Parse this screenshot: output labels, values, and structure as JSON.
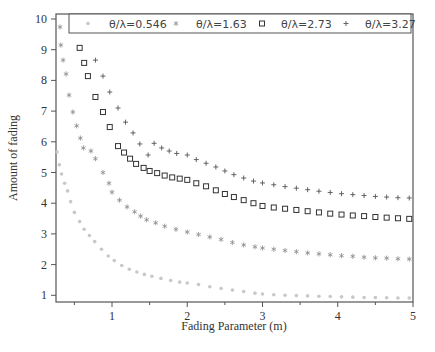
{
  "chart_data": {
    "type": "scatter",
    "title": "",
    "xlabel": "Fading Parameter (m)",
    "ylabel": "Amount of fading",
    "xlim": [
      0.25,
      5.0
    ],
    "ylim": [
      0.77,
      10.1
    ],
    "x_ticks": [
      1,
      2,
      3,
      4,
      5
    ],
    "x_minor_ticks": [
      0.5,
      1.5,
      2.5,
      3.5,
      4.5
    ],
    "y_ticks": [
      1,
      2,
      3,
      4,
      5,
      6,
      7,
      8,
      9,
      10
    ],
    "grid": false,
    "legend_position": "top-inside",
    "series": [
      {
        "name": "θ/λ=0.546",
        "marker": "dot",
        "color": "#c8c8c8",
        "points": [
          [
            0.27,
            5.67
          ],
          [
            0.3,
            5.25
          ],
          [
            0.33,
            4.95
          ],
          [
            0.37,
            4.65
          ],
          [
            0.41,
            4.4
          ],
          [
            0.45,
            4.05
          ],
          [
            0.5,
            3.7
          ],
          [
            0.57,
            3.4
          ],
          [
            0.63,
            3.15
          ],
          [
            0.7,
            2.95
          ],
          [
            0.77,
            2.75
          ],
          [
            0.86,
            2.5
          ],
          [
            0.95,
            2.28
          ],
          [
            1.03,
            2.13
          ],
          [
            1.13,
            1.97
          ],
          [
            1.23,
            1.85
          ],
          [
            1.33,
            1.76
          ],
          [
            1.43,
            1.68
          ],
          [
            1.53,
            1.62
          ],
          [
            1.65,
            1.55
          ],
          [
            1.78,
            1.48
          ],
          [
            1.9,
            1.43
          ],
          [
            2.0,
            1.4
          ],
          [
            2.15,
            1.35
          ],
          [
            2.3,
            1.28
          ],
          [
            2.45,
            1.22
          ],
          [
            2.6,
            1.17
          ],
          [
            2.75,
            1.12
          ],
          [
            2.9,
            1.07
          ],
          [
            3.0,
            1.04
          ],
          [
            3.15,
            1.02
          ],
          [
            3.3,
            1.0
          ],
          [
            3.45,
            0.99
          ],
          [
            3.6,
            0.98
          ],
          [
            3.75,
            0.97
          ],
          [
            3.9,
            0.96
          ],
          [
            4.05,
            0.95
          ],
          [
            4.2,
            0.94
          ],
          [
            4.35,
            0.93
          ],
          [
            4.5,
            0.93
          ],
          [
            4.65,
            0.92
          ],
          [
            4.8,
            0.91
          ],
          [
            4.95,
            0.91
          ]
        ]
      },
      {
        "name": "θ/λ=1.63",
        "marker": "star",
        "color": "#8a8a8a",
        "points": [
          [
            0.31,
            9.74
          ],
          [
            0.32,
            9.15
          ],
          [
            0.35,
            8.66
          ],
          [
            0.39,
            8.21
          ],
          [
            0.43,
            7.52
          ],
          [
            0.48,
            6.97
          ],
          [
            0.53,
            6.52
          ],
          [
            0.58,
            6.12
          ],
          [
            0.62,
            5.8
          ],
          [
            0.72,
            5.7
          ],
          [
            0.78,
            5.45
          ],
          [
            0.88,
            5.0
          ],
          [
            0.96,
            4.65
          ],
          [
            1.0,
            4.36
          ],
          [
            1.1,
            4.1
          ],
          [
            1.2,
            3.88
          ],
          [
            1.3,
            3.72
          ],
          [
            1.38,
            3.58
          ],
          [
            1.46,
            3.46
          ],
          [
            1.58,
            3.36
          ],
          [
            1.7,
            3.25
          ],
          [
            1.85,
            3.15
          ],
          [
            2.0,
            3.06
          ],
          [
            2.15,
            2.98
          ],
          [
            2.3,
            2.9
          ],
          [
            2.45,
            2.82
          ],
          [
            2.6,
            2.72
          ],
          [
            2.75,
            2.64
          ],
          [
            2.9,
            2.58
          ],
          [
            3.0,
            2.54
          ],
          [
            3.15,
            2.5
          ],
          [
            3.3,
            2.46
          ],
          [
            3.45,
            2.42
          ],
          [
            3.6,
            2.38
          ],
          [
            3.75,
            2.35
          ],
          [
            3.9,
            2.32
          ],
          [
            4.05,
            2.29
          ],
          [
            4.2,
            2.27
          ],
          [
            4.35,
            2.24
          ],
          [
            4.5,
            2.22
          ],
          [
            4.65,
            2.21
          ],
          [
            4.8,
            2.19
          ],
          [
            4.95,
            2.18
          ]
        ]
      },
      {
        "name": "θ/λ=2.73",
        "marker": "square",
        "color": "#333333",
        "points": [
          [
            0.57,
            9.06
          ],
          [
            0.63,
            8.57
          ],
          [
            0.68,
            8.14
          ],
          [
            0.78,
            7.46
          ],
          [
            0.88,
            6.97
          ],
          [
            0.97,
            6.48
          ],
          [
            1.08,
            5.86
          ],
          [
            1.16,
            5.65
          ],
          [
            1.24,
            5.45
          ],
          [
            1.32,
            5.28
          ],
          [
            1.42,
            5.15
          ],
          [
            1.5,
            5.05
          ],
          [
            1.6,
            4.98
          ],
          [
            1.7,
            4.9
          ],
          [
            1.8,
            4.84
          ],
          [
            1.9,
            4.8
          ],
          [
            2.0,
            4.76
          ],
          [
            2.12,
            4.65
          ],
          [
            2.25,
            4.55
          ],
          [
            2.38,
            4.42
          ],
          [
            2.5,
            4.3
          ],
          [
            2.62,
            4.2
          ],
          [
            2.75,
            4.1
          ],
          [
            2.88,
            4.0
          ],
          [
            3.0,
            3.91
          ],
          [
            3.15,
            3.86
          ],
          [
            3.3,
            3.82
          ],
          [
            3.45,
            3.78
          ],
          [
            3.6,
            3.74
          ],
          [
            3.75,
            3.7
          ],
          [
            3.9,
            3.66
          ],
          [
            4.05,
            3.63
          ],
          [
            4.2,
            3.6
          ],
          [
            4.35,
            3.58
          ],
          [
            4.5,
            3.55
          ],
          [
            4.65,
            3.53
          ],
          [
            4.8,
            3.51
          ],
          [
            4.95,
            3.49
          ]
        ]
      },
      {
        "name": "θ/λ=3.27",
        "marker": "plus",
        "color": "#555555",
        "points": [
          [
            0.78,
            8.66
          ],
          [
            0.88,
            8.14
          ],
          [
            0.97,
            7.62
          ],
          [
            1.08,
            7.1
          ],
          [
            1.18,
            6.64
          ],
          [
            1.28,
            6.29
          ],
          [
            1.37,
            5.93
          ],
          [
            1.48,
            5.57
          ],
          [
            1.56,
            5.95
          ],
          [
            1.66,
            5.8
          ],
          [
            1.76,
            5.7
          ],
          [
            1.86,
            5.62
          ],
          [
            2.0,
            5.57
          ],
          [
            2.12,
            5.42
          ],
          [
            2.25,
            5.3
          ],
          [
            2.38,
            5.18
          ],
          [
            2.5,
            5.05
          ],
          [
            2.62,
            4.93
          ],
          [
            2.75,
            4.82
          ],
          [
            2.88,
            4.72
          ],
          [
            3.0,
            4.66
          ],
          [
            3.15,
            4.6
          ],
          [
            3.3,
            4.54
          ],
          [
            3.45,
            4.49
          ],
          [
            3.6,
            4.44
          ],
          [
            3.75,
            4.39
          ],
          [
            3.9,
            4.35
          ],
          [
            4.05,
            4.31
          ],
          [
            4.2,
            4.28
          ],
          [
            4.35,
            4.25
          ],
          [
            4.5,
            4.22
          ],
          [
            4.65,
            4.2
          ],
          [
            4.8,
            4.18
          ],
          [
            4.95,
            4.17
          ]
        ]
      }
    ]
  },
  "legend": {
    "items": [
      {
        "label": "θ/λ=0.546",
        "marker": "dot"
      },
      {
        "label": "θ/λ=1.63",
        "marker": "star"
      },
      {
        "label": "θ/λ=2.73",
        "marker": "square"
      },
      {
        "label": "θ/λ=3.27",
        "marker": "plus"
      }
    ]
  },
  "axes": {
    "x_title": "Fading Parameter (m)",
    "y_title": "Amount of fading",
    "x_tick_labels": [
      "1",
      "2",
      "3",
      "4",
      "5"
    ],
    "y_tick_labels": [
      "1",
      "2",
      "3",
      "4",
      "5",
      "6",
      "7",
      "8",
      "9",
      "10"
    ]
  }
}
